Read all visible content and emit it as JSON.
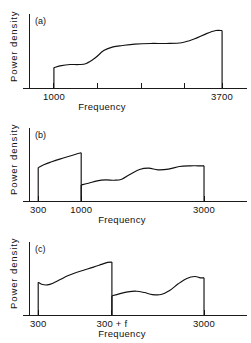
{
  "figure": {
    "ylabel": "Power density",
    "xlabel": "Frequency",
    "stroke_color": "#111111",
    "background_color": "#ffffff"
  },
  "chart_data": [
    {
      "type": "line",
      "panel": "a",
      "panel_label": "(a)",
      "title": "",
      "xlabel": "Frequency",
      "ylabel": "Power density",
      "grid": false,
      "legend": null,
      "xlim": [
        600,
        4100
      ],
      "ylim": [
        0,
        1
      ],
      "xticks": [
        1000,
        1700,
        2400,
        3100,
        3700
      ],
      "xticklabels": [
        "1000",
        "",
        "",
        "",
        "3700"
      ],
      "bands": [
        {
          "x_start": 1000,
          "x_end": 3700,
          "x": [
            1000,
            1120,
            1260,
            1400,
            1520,
            1660,
            1800,
            1950,
            2100,
            2300,
            2550,
            2800,
            3050,
            3250,
            3450,
            3600,
            3700
          ],
          "y": [
            0.3,
            0.33,
            0.345,
            0.345,
            0.36,
            0.44,
            0.55,
            0.605,
            0.625,
            0.645,
            0.655,
            0.655,
            0.665,
            0.72,
            0.8,
            0.845,
            0.845
          ],
          "drop_to_zero_at_end": true,
          "rise_from_zero_at_start": true
        }
      ]
    },
    {
      "type": "line",
      "panel": "b",
      "panel_label": "(b)",
      "title": "",
      "xlabel": "Frequency",
      "ylabel": "Power density",
      "grid": false,
      "legend": null,
      "xlim": [
        150,
        3700
      ],
      "ylim": [
        0,
        1
      ],
      "xticks": [
        300,
        1000,
        3000
      ],
      "xticklabels": [
        "300",
        "1000",
        "3000"
      ],
      "bands": [
        {
          "x_start": 300,
          "x_end": 1000,
          "x": [
            300,
            400,
            520,
            650,
            790,
            900,
            1000
          ],
          "y": [
            0.5,
            0.545,
            0.585,
            0.625,
            0.665,
            0.695,
            0.72
          ],
          "rise_from_zero_at_start": true,
          "drop_to_zero_at_end": true
        },
        {
          "x_start": 1000,
          "x_end": 3000,
          "x": [
            1000,
            1120,
            1260,
            1400,
            1540,
            1660,
            1800,
            1950,
            2100,
            2250,
            2420,
            2600,
            2780,
            2900,
            3000
          ],
          "y": [
            0.24,
            0.265,
            0.3,
            0.315,
            0.31,
            0.325,
            0.4,
            0.47,
            0.49,
            0.465,
            0.475,
            0.515,
            0.525,
            0.525,
            0.525
          ],
          "rise_from_zero_at_start": true,
          "drop_to_zero_at_end": true
        }
      ]
    },
    {
      "type": "line",
      "panel": "c",
      "panel_label": "(c)",
      "title": "",
      "xlabel": "Frequency",
      "ylabel": "Power density",
      "grid": false,
      "legend": null,
      "xlim": [
        150,
        3700
      ],
      "ylim": [
        0,
        1
      ],
      "xticks": [
        300,
        1500,
        3000
      ],
      "xticklabels": [
        "300",
        "300 + f",
        "3000"
      ],
      "bands": [
        {
          "x_start": 300,
          "x_end": 1500,
          "x": [
            300,
            370,
            450,
            540,
            650,
            780,
            920,
            1060,
            1200,
            1330,
            1430,
            1500
          ],
          "y": [
            0.49,
            0.455,
            0.45,
            0.475,
            0.525,
            0.585,
            0.635,
            0.675,
            0.715,
            0.755,
            0.785,
            0.79
          ],
          "rise_from_zero_at_start": true,
          "drop_to_zero_at_end": true
        },
        {
          "x_start": 1500,
          "x_end": 3000,
          "x": [
            1500,
            1620,
            1760,
            1900,
            2030,
            2160,
            2300,
            2440,
            2580,
            2720,
            2850,
            2940,
            3000
          ],
          "y": [
            0.285,
            0.315,
            0.345,
            0.355,
            0.335,
            0.305,
            0.305,
            0.365,
            0.465,
            0.545,
            0.575,
            0.555,
            0.555
          ],
          "rise_from_zero_at_start": true,
          "drop_to_zero_at_end": true
        }
      ]
    }
  ]
}
